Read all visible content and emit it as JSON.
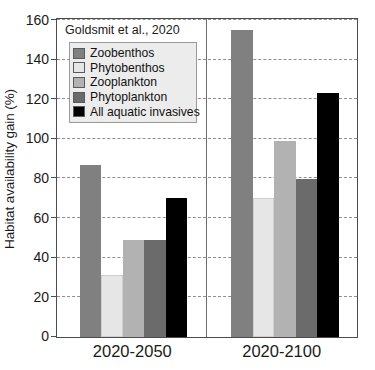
{
  "chart_data": {
    "type": "bar",
    "title": "",
    "annotation": "Goldsmit et al., 2020",
    "xlabel": "",
    "ylabel": "Habitat availability gain (%)",
    "categories": [
      "2020-2050",
      "2020-2100"
    ],
    "ylim": [
      0,
      160
    ],
    "yticks": [
      0,
      20,
      40,
      60,
      80,
      100,
      120,
      140,
      160
    ],
    "ytick_labels": [
      "0",
      "20",
      "40",
      "60",
      "80",
      "100",
      "120",
      "140",
      "160"
    ],
    "grid": true,
    "legend_position": "top-left",
    "series": [
      {
        "name": "Zoobenthos",
        "color": "#808080",
        "values": [
          87,
          155
        ]
      },
      {
        "name": "Phytobenthos",
        "color": "#e6e6e6",
        "values": [
          31.5,
          70
        ]
      },
      {
        "name": "Zooplankton",
        "color": "#b2b2b2",
        "values": [
          49,
          99
        ]
      },
      {
        "name": "Phytoplankton",
        "color": "#6b6b6b",
        "values": [
          49,
          80
        ]
      },
      {
        "name": "All aquatic invasives",
        "color": "#000000",
        "values": [
          70,
          123
        ]
      }
    ]
  },
  "axis": {
    "ylabel": "Habitat availability gain (%)"
  },
  "colors": {
    "axis": "#4c4c4c",
    "grid": "#8f8f8f",
    "text": "#1a1a1a",
    "legend_bg": "#ececec",
    "legend_border": "#9a9a9a"
  }
}
